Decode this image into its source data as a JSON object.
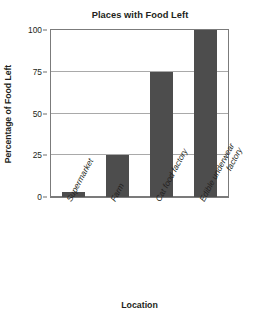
{
  "chart_data": {
    "type": "bar",
    "title": "Places with Food Left",
    "xlabel": "Location",
    "ylabel": "Percentage of Food Left",
    "categories": [
      "Supermarket",
      "Farm",
      "Cat food factory",
      "Edible underwear factory"
    ],
    "values": [
      3,
      25,
      75,
      100
    ],
    "ylim": [
      0,
      100
    ],
    "yticks": [
      0,
      25,
      50,
      75,
      100
    ],
    "ytick_labels": [
      "0",
      "25",
      "50",
      "75",
      "100"
    ],
    "grid": true,
    "legend": false,
    "bar_color": "#4d4d4d",
    "axis_color": "#7b7b7b",
    "grid_color": "#a9a9a9",
    "background": "#ffffff"
  },
  "xtick_lines": [
    [
      "Supermarket"
    ],
    [
      "Farm"
    ],
    [
      "Cat food factory"
    ],
    [
      "Edible underwear",
      "factory"
    ]
  ]
}
